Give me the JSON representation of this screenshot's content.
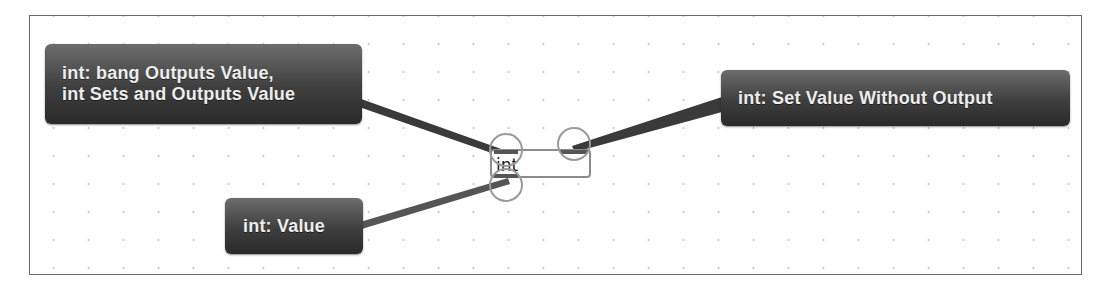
{
  "object_box": {
    "label": "int",
    "inlets": [
      "left-inlet",
      "right-inlet"
    ],
    "outlets": [
      "outlet"
    ]
  },
  "hints": {
    "left_inlet": {
      "lines": [
        "int:  bang Outputs Value,",
        "int Sets and Outputs Value"
      ]
    },
    "right_inlet": {
      "lines": [
        "int:  Set Value Without Output"
      ]
    },
    "outlet": {
      "lines": [
        "int:  Value"
      ]
    }
  },
  "colors": {
    "hint_bg_top": "#6d6d6d",
    "hint_bg_bottom": "#2a2a2a",
    "hint_text": "#ededed",
    "canvas_border": "#6a6a6a",
    "ring": "#9a9a9a",
    "wire": "#3a3a3a"
  }
}
